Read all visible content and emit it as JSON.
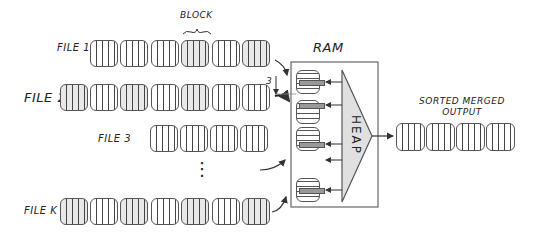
{
  "labels": {
    "block": "BLOCK",
    "ram": "RAM",
    "heap": "HEAP",
    "output": "SORTED MERGED\nOUTPUT",
    "output_line1": "SORTED MERGED",
    "output_line2": "OUTPUT",
    "buffer_size": "3"
  },
  "files": [
    {
      "label": "FILE 1",
      "blocks": 6
    },
    {
      "label": "FILE 2",
      "blocks": 7
    },
    {
      "label": "FILE 3",
      "blocks": 4
    },
    {
      "label": "FILE K",
      "blocks": 7
    }
  ],
  "ellipsis": "⋮",
  "output_blocks": 4,
  "colors": {
    "stroke": "#555555",
    "heap_fill": "#e0e0e0",
    "buffer_bar": "#999999"
  }
}
